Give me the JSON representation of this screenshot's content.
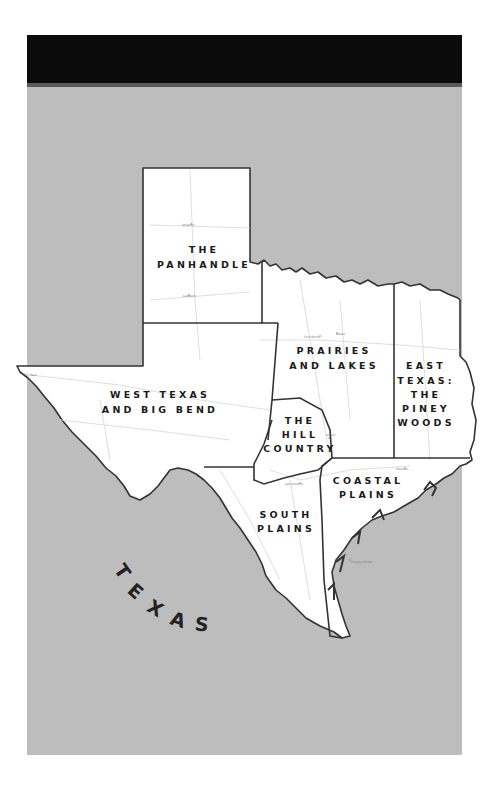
{
  "map": {
    "title": "TEXAS",
    "colors": {
      "header": "#0b0b0b",
      "water_background": "#bdbdbd",
      "land": "#ffffff",
      "border": "#333333",
      "roads": "#d6d6d6",
      "text": "#1a1a1a"
    },
    "regions": [
      {
        "id": "panhandle",
        "lines": [
          "THE",
          "PANHANDLE"
        ]
      },
      {
        "id": "prairies-lakes",
        "lines": [
          "PRAIRIES",
          "AND LAKES"
        ]
      },
      {
        "id": "piney-woods",
        "lines": [
          "EAST",
          "TEXAS:",
          "THE",
          "PINEY",
          "WOODS"
        ]
      },
      {
        "id": "west-texas",
        "lines": [
          "WEST TEXAS",
          "AND BIG BEND"
        ]
      },
      {
        "id": "hill-country",
        "lines": [
          "THE",
          "HILL",
          "COUNTRY"
        ]
      },
      {
        "id": "coastal-plains",
        "lines": [
          "COASTAL",
          "PLAINS"
        ]
      },
      {
        "id": "south-plains",
        "lines": [
          "SOUTH",
          "PLAINS"
        ]
      }
    ],
    "state_label_letters": [
      "T",
      "E",
      "X",
      "A",
      "S"
    ],
    "cities": [
      {
        "name": "Amarillo"
      },
      {
        "name": "Lubbock"
      },
      {
        "name": "Fort Worth"
      },
      {
        "name": "Dallas"
      },
      {
        "name": "El Paso"
      },
      {
        "name": "Austin"
      },
      {
        "name": "San Antonio"
      },
      {
        "name": "Houston"
      },
      {
        "name": "Corpus Christi"
      }
    ]
  }
}
